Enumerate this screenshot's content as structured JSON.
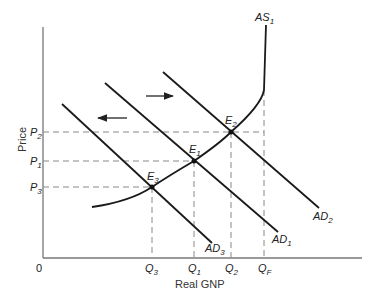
{
  "diagram": {
    "type": "economics-AD-AS",
    "axes": {
      "x_label": "Real GNP",
      "y_label": "Price",
      "origin_label": "0"
    },
    "curves": {
      "as": {
        "label": "AS",
        "sub": "1"
      },
      "ad1": {
        "label": "AD",
        "sub": "1"
      },
      "ad2": {
        "label": "AD",
        "sub": "2"
      },
      "ad3": {
        "label": "AD",
        "sub": "3"
      }
    },
    "equilibria": {
      "e1": {
        "label": "E",
        "sub": "1"
      },
      "e2": {
        "label": "E",
        "sub": "2"
      },
      "e3": {
        "label": "E",
        "sub": "3"
      }
    },
    "price_levels": {
      "p1": {
        "label": "P",
        "sub": "1"
      },
      "p2": {
        "label": "P",
        "sub": "2"
      },
      "p3": {
        "label": "P",
        "sub": "3"
      }
    },
    "quantities": {
      "q1": {
        "label": "Q",
        "sub": "1"
      },
      "q2": {
        "label": "Q",
        "sub": "2"
      },
      "q3": {
        "label": "Q",
        "sub": "3"
      },
      "qf": {
        "label": "Q",
        "sub": "F"
      }
    },
    "arrows": {
      "right": "shift right (AD1 to AD2)",
      "left": "shift left (AD1 to AD3)"
    },
    "colors": {
      "line": "#1a1a1a",
      "axis": "#777777",
      "dashed": "#888888"
    }
  }
}
